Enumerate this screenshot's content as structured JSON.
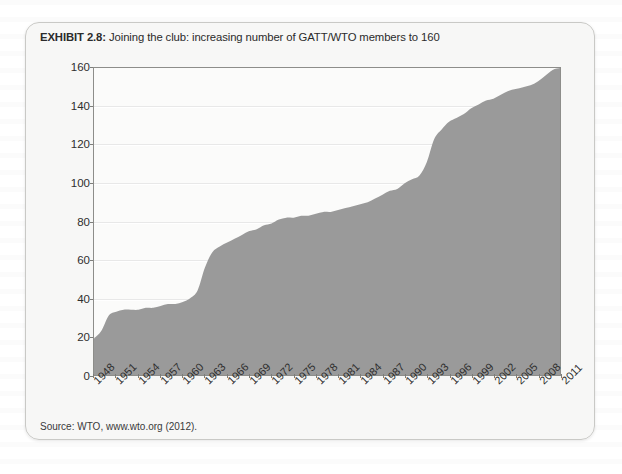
{
  "exhibit": {
    "label": "EXHIBIT 2.8:",
    "title": "Joining the club: increasing number of GATT/WTO members to 160",
    "source": "Source: WTO, www.wto.org (2012)."
  },
  "colors": {
    "area_fill": "#9a9a9a",
    "plot_background": "#fbfbfa",
    "axis": "#8d8d8a",
    "card_background": "#f6f6f5",
    "card_border": "#c9c9c6",
    "text": "#2b2b2b"
  },
  "chart_data": {
    "type": "area",
    "title": "Joining the club: increasing number of GATT/WTO members to 160",
    "xlabel": "",
    "ylabel": "",
    "ylim": [
      0,
      160
    ],
    "xlim": [
      1948,
      2011
    ],
    "grid": true,
    "legend": false,
    "y_ticks": [
      0,
      20,
      40,
      60,
      80,
      100,
      120,
      140,
      160
    ],
    "x_ticks": [
      "1948",
      "1951",
      "1954",
      "1957",
      "1960",
      "1963",
      "1966",
      "1969",
      "1972",
      "1975",
      "1978",
      "1981",
      "1984",
      "1987",
      "1990",
      "1993",
      "1996",
      "1999",
      "2002",
      "2005",
      "2008",
      "2011"
    ],
    "series": [
      {
        "name": "GATT/WTO members",
        "x": [
          1948,
          1949,
          1950,
          1951,
          1952,
          1953,
          1954,
          1955,
          1956,
          1957,
          1958,
          1959,
          1960,
          1961,
          1962,
          1963,
          1964,
          1965,
          1966,
          1967,
          1968,
          1969,
          1970,
          1971,
          1972,
          1973,
          1974,
          1975,
          1976,
          1977,
          1978,
          1979,
          1980,
          1981,
          1982,
          1983,
          1984,
          1985,
          1986,
          1987,
          1988,
          1989,
          1990,
          1991,
          1992,
          1993,
          1994,
          1995,
          1996,
          1997,
          1998,
          1999,
          2000,
          2001,
          2002,
          2003,
          2004,
          2005,
          2006,
          2007,
          2008,
          2009,
          2010,
          2011
        ],
        "values": [
          19,
          23,
          31,
          33,
          34,
          34,
          34,
          35,
          35,
          36,
          37,
          37,
          38,
          40,
          44,
          56,
          64,
          67,
          69,
          71,
          73,
          75,
          76,
          78,
          79,
          81,
          82,
          82,
          83,
          83,
          84,
          85,
          85,
          86,
          87,
          88,
          89,
          90,
          92,
          94,
          96,
          97,
          100,
          102,
          104,
          111,
          123,
          128,
          132,
          134,
          136,
          139,
          141,
          143,
          144,
          146,
          148,
          149,
          150,
          151,
          153,
          156,
          159,
          160
        ]
      }
    ],
    "annotations": [
      {
        "text": "Rapid membership growth in the early 1960s and again after the 1995 founding of the WTO",
        "visible": false
      }
    ]
  }
}
